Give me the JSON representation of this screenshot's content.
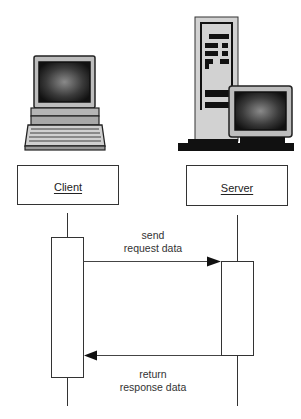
{
  "diagram": {
    "type": "sequence",
    "participants": [
      {
        "id": "client",
        "label": "Client",
        "icon": "desktop-computer-icon"
      },
      {
        "id": "server",
        "label": "Server",
        "icon": "server-tower-icon"
      }
    ],
    "messages": [
      {
        "from": "client",
        "to": "server",
        "label_line1": "send",
        "label_line2": "request data"
      },
      {
        "from": "server",
        "to": "client",
        "label_line1": "return",
        "label_line2": "response data"
      }
    ]
  },
  "colors": {
    "line": "#333333",
    "screen_dark": "#1a1a1a",
    "case_gray": "#c8c8c8"
  }
}
